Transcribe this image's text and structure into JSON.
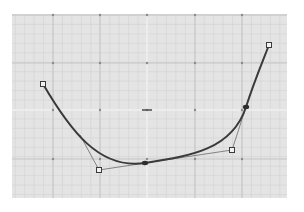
{
  "editor": {
    "grid": {
      "left": 12,
      "top": 14,
      "right": 287,
      "bottom": 198,
      "bg_color": "#e4e4e4",
      "minor_step": 9.45,
      "minor_color": "#d2d2d2",
      "major_xs": [
        53,
        100,
        147,
        195,
        242
      ],
      "major_ys": [
        15,
        63,
        110,
        159
      ],
      "major_color": "#c4c4c4",
      "dot_color": "#8a8a8a",
      "axis_color": "#f6f6f6",
      "axis_x": 147,
      "axis_y": 110
    },
    "curve": {
      "color": "#3a3a3a",
      "width": 2,
      "segments": [
        {
          "p0": [
            43,
            84
          ],
          "c1": [
            70,
            130
          ],
          "c2": [
            99,
            170
          ],
          "p1": [
            145,
            163
          ]
        },
        {
          "p0": [
            145,
            163
          ],
          "c1": [
            190,
            156
          ],
          "c2": [
            232,
            150
          ],
          "p1": [
            246,
            107
          ]
        },
        {
          "p0": [
            246,
            107
          ],
          "c1": [
            254,
            82
          ],
          "c2": [
            262,
            63
          ],
          "p1": [
            269,
            45
          ]
        }
      ]
    },
    "handles": {
      "line_color": "#6a6a6a",
      "lines": [
        {
          "from": [
            80,
            135
          ],
          "to": [
            99,
            170
          ]
        },
        {
          "from": [
            99,
            170
          ],
          "to": [
            145,
            163
          ]
        },
        {
          "from": [
            145,
            163
          ],
          "to": [
            232,
            150
          ]
        },
        {
          "from": [
            232,
            150
          ],
          "to": [
            246,
            107
          ]
        }
      ],
      "square_points": [
        [
          43,
          84
        ],
        [
          99,
          170
        ],
        [
          232,
          150
        ],
        [
          269,
          45
        ]
      ],
      "anchor_points": [
        [
          145,
          163
        ],
        [
          246,
          107
        ]
      ]
    }
  }
}
